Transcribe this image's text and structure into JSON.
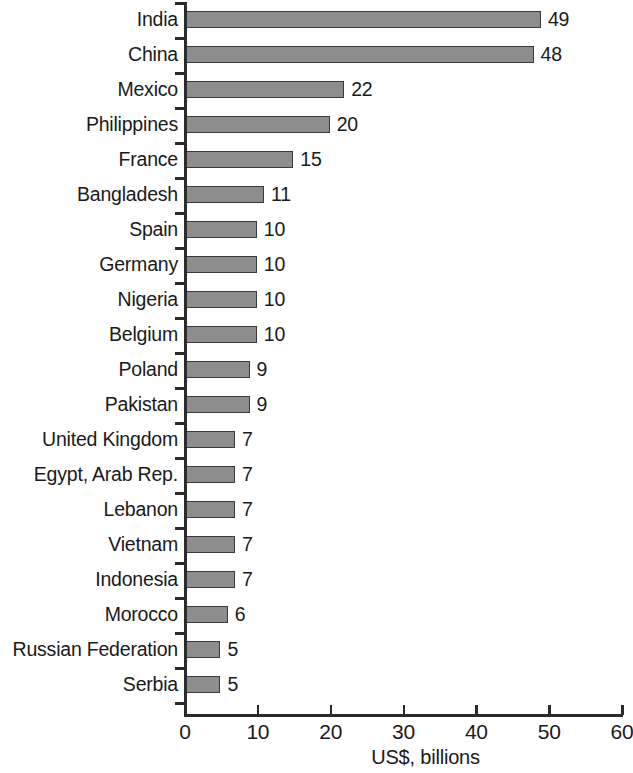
{
  "chart_data": {
    "type": "bar",
    "orientation": "horizontal",
    "title": "",
    "subtitle": "",
    "xlabel": "US$, billions",
    "ylabel": "",
    "xlim": [
      0,
      60
    ],
    "xticks": [
      0,
      10,
      20,
      30,
      40,
      50,
      60
    ],
    "xtick_labels": [
      "0",
      "10",
      "20",
      "30",
      "40",
      "50",
      "60"
    ],
    "grid": false,
    "legend": null,
    "bar_color": "#8d8d8d",
    "bar_edge_color": "#3a3a3a",
    "axis_color": "#2b2b2b",
    "categories": [
      "India",
      "China",
      "Mexico",
      "Philippines",
      "France",
      "Bangladesh",
      "Spain",
      "Germany",
      "Nigeria",
      "Belgium",
      "Poland",
      "Pakistan",
      "United Kingdom",
      "Egypt, Arab Rep.",
      "Lebanon",
      "Vietnam",
      "Indonesia",
      "Morocco",
      "Russian Federation",
      "Serbia"
    ],
    "values": [
      49,
      48,
      22,
      20,
      15,
      11,
      10,
      10,
      10,
      10,
      9,
      9,
      7,
      7,
      7,
      7,
      7,
      6,
      5,
      5
    ],
    "value_labels": [
      "49",
      "48",
      "22",
      "20",
      "15",
      "11",
      "10",
      "10",
      "10",
      "10",
      "9",
      "9",
      "7",
      "7",
      "7",
      "7",
      "7",
      "6",
      "5",
      "5"
    ]
  }
}
